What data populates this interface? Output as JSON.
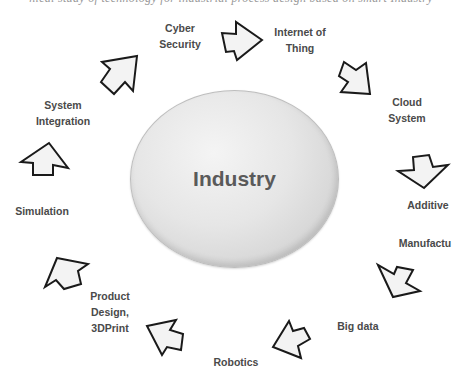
{
  "diagram": {
    "type": "cycle",
    "top_cutoff_text": "nical study of technology for industrial process design based on smart Industry",
    "hub": {
      "label": "Industry"
    },
    "nodes": [
      {
        "id": "cyber-security",
        "lines": [
          "Cyber",
          "Security"
        ]
      },
      {
        "id": "internet-of-thing",
        "lines": [
          "Internet of",
          "Thing"
        ]
      },
      {
        "id": "cloud-system",
        "lines": [
          "Cloud",
          "System"
        ]
      },
      {
        "id": "additive",
        "lines": [
          "Additive"
        ]
      },
      {
        "id": "manufactu",
        "lines": [
          "Manufactu"
        ]
      },
      {
        "id": "big-data",
        "lines": [
          "Big data"
        ]
      },
      {
        "id": "robotics",
        "lines": [
          "Robotics"
        ]
      },
      {
        "id": "product-design",
        "lines": [
          "Product",
          "Design,",
          "3DPrint"
        ]
      },
      {
        "id": "simulation",
        "lines": [
          "Simulation"
        ]
      },
      {
        "id": "system-integration",
        "lines": [
          "System",
          "Integration"
        ]
      }
    ],
    "arrows": [
      {
        "from": "system-integration",
        "to": "cyber-security",
        "direction": "up-right"
      },
      {
        "from": "cyber-security",
        "to": "internet-of-thing",
        "direction": "right"
      },
      {
        "from": "internet-of-thing",
        "to": "cloud-system",
        "direction": "down-right"
      },
      {
        "from": "cloud-system",
        "to": "additive",
        "direction": "down"
      },
      {
        "from": "manufactu",
        "to": "big-data",
        "direction": "down-left"
      },
      {
        "from": "big-data",
        "to": "robotics",
        "direction": "up-left"
      },
      {
        "from": "robotics",
        "to": "product-design",
        "direction": "up-left"
      },
      {
        "from": "product-design",
        "to": "simulation",
        "direction": "up-left"
      },
      {
        "from": "simulation",
        "to": "system-integration",
        "direction": "up"
      }
    ],
    "colors": {
      "text": "#4a4a4a",
      "hub_fill": "#e6e6e6",
      "arrow_fill": "#f3f3f3",
      "arrow_stroke": "#1a1a1a"
    }
  }
}
